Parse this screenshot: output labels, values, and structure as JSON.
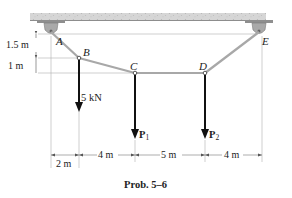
{
  "figure": {
    "caption": "Prob. 5–6",
    "points": {
      "A": "A",
      "B": "B",
      "C": "C",
      "D": "D",
      "E": "E"
    },
    "loads": {
      "B": "5 kN",
      "C_sym": "P",
      "C_sub": "1",
      "D_sym": "P",
      "D_sub": "2"
    },
    "vertical_dims": {
      "A_to_B": "1.5 m",
      "B_to_C": "1 m"
    },
    "horizontal_dims": {
      "A_to_B": "2 m",
      "B_to_C": "4 m",
      "C_to_D": "5 m",
      "D_to_E": "4 m"
    },
    "colors": {
      "cable": "#a8a8a8",
      "ceiling": "#cfcfcf",
      "support": "#9a9a9a",
      "arrow": "#111111",
      "dim_line": "#888888"
    }
  }
}
